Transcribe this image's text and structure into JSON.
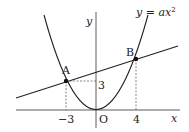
{
  "diagram": {
    "type": "coordinate-graph",
    "curve_label": "y = ax²",
    "curve_label_parts": {
      "lhs": "y",
      "eq": " = ",
      "rhs": "ax",
      "exp": "2"
    },
    "axes": {
      "x_label": "x",
      "y_label": "y",
      "origin_label": "O"
    },
    "points": [
      {
        "name": "A",
        "x": -3,
        "y": 3
      },
      {
        "name": "B",
        "x": 4,
        "y": 5.333
      }
    ],
    "tick_labels": {
      "x_neg": "−3",
      "x_pos": "4",
      "y_val": "3"
    },
    "colors": {
      "stroke": "#222222",
      "guide": "#555555",
      "background": "#ffffff"
    }
  }
}
